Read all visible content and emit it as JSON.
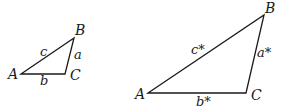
{
  "diagram": {
    "stroke_color": "#1a1a1a",
    "small_triangle": {
      "vertices": {
        "A": {
          "label": "A",
          "x": 21,
          "y": 74
        },
        "B": {
          "label": "B",
          "x": 74,
          "y": 38
        },
        "C": {
          "label": "C",
          "x": 65,
          "y": 74
        }
      },
      "sides": {
        "a": {
          "label": "a",
          "between": "B-C"
        },
        "b": {
          "label": "b",
          "between": "A-C"
        },
        "c": {
          "label": "c",
          "between": "A-B"
        }
      }
    },
    "large_triangle": {
      "vertices": {
        "A": {
          "label": "A",
          "x": 148,
          "y": 93
        },
        "B": {
          "label": "B",
          "x": 264,
          "y": 15
        },
        "C": {
          "label": "C",
          "x": 246,
          "y": 93
        }
      },
      "sides": {
        "a": {
          "label": "a*",
          "between": "B-C"
        },
        "b": {
          "label": "b*",
          "between": "A-C"
        },
        "c": {
          "label": "c*",
          "between": "A-B"
        }
      }
    }
  }
}
